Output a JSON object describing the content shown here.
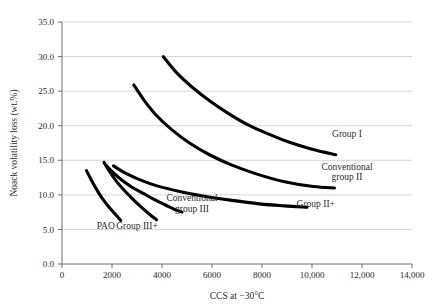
{
  "chart_data": {
    "type": "line",
    "title": "",
    "xlabel": "CCS at −30°C",
    "ylabel": "Noack volatility loss (wt.%)",
    "xlim": [
      0,
      14000
    ],
    "ylim": [
      0,
      35
    ],
    "grid": "horizontal",
    "legend": "inline-labels",
    "x_ticks": [
      "0",
      "2000",
      "4000",
      "6000",
      "8000",
      "10,000",
      "12,000",
      "14,000"
    ],
    "x_tick_values": [
      0,
      2000,
      4000,
      6000,
      8000,
      10000,
      12000,
      14000
    ],
    "y_ticks": [
      "0.0",
      "5.0",
      "10.0",
      "15.0",
      "20.0",
      "25.0",
      "30.0",
      "35.0"
    ],
    "y_tick_values": [
      0,
      5,
      10,
      15,
      20,
      25,
      30,
      35
    ],
    "series": [
      {
        "name": "Group I",
        "label": "Group I",
        "label_lines": [
          "Group I"
        ],
        "label_x": 11400,
        "label_y": 18.3,
        "points": [
          {
            "x": 4050,
            "y": 30.0
          },
          {
            "x": 4600,
            "y": 27.6
          },
          {
            "x": 5200,
            "y": 25.6
          },
          {
            "x": 5900,
            "y": 23.6
          },
          {
            "x": 6600,
            "y": 21.9
          },
          {
            "x": 7400,
            "y": 20.2
          },
          {
            "x": 8200,
            "y": 18.9
          },
          {
            "x": 9100,
            "y": 17.6
          },
          {
            "x": 10000,
            "y": 16.6
          },
          {
            "x": 10950,
            "y": 15.8
          }
        ]
      },
      {
        "name": "Conventional group II",
        "label": "Conventional group II",
        "label_lines": [
          "Conventional",
          "group II"
        ],
        "label_x": 11400,
        "label_y": 13.6,
        "points": [
          {
            "x": 2870,
            "y": 25.9
          },
          {
            "x": 3300,
            "y": 23.6
          },
          {
            "x": 3800,
            "y": 21.4
          },
          {
            "x": 4400,
            "y": 19.4
          },
          {
            "x": 5100,
            "y": 17.5
          },
          {
            "x": 5900,
            "y": 15.8
          },
          {
            "x": 6800,
            "y": 14.3
          },
          {
            "x": 7800,
            "y": 13.0
          },
          {
            "x": 8900,
            "y": 11.9
          },
          {
            "x": 10050,
            "y": 11.2
          },
          {
            "x": 10900,
            "y": 11.0
          }
        ]
      },
      {
        "name": "Group II+",
        "label": "Group II+",
        "label_lines": [
          "Group II+"
        ],
        "label_x": 10150,
        "label_y": 8.3,
        "points": [
          {
            "x": 2060,
            "y": 14.2
          },
          {
            "x": 2500,
            "y": 13.2
          },
          {
            "x": 3100,
            "y": 12.2
          },
          {
            "x": 3800,
            "y": 11.3
          },
          {
            "x": 4700,
            "y": 10.5
          },
          {
            "x": 5700,
            "y": 9.8
          },
          {
            "x": 6800,
            "y": 9.2
          },
          {
            "x": 7900,
            "y": 8.7
          },
          {
            "x": 8900,
            "y": 8.4
          },
          {
            "x": 9800,
            "y": 8.2
          }
        ]
      },
      {
        "name": "Conventional group III",
        "label": "Conventional group III",
        "label_lines": [
          "Conventional",
          "group III"
        ],
        "label_x": 5200,
        "label_y": 9.1,
        "points": [
          {
            "x": 1780,
            "y": 14.2
          },
          {
            "x": 2050,
            "y": 13.2
          },
          {
            "x": 2400,
            "y": 12.1
          },
          {
            "x": 2800,
            "y": 11.1
          },
          {
            "x": 3250,
            "y": 10.2
          },
          {
            "x": 3700,
            "y": 9.3
          },
          {
            "x": 4150,
            "y": 8.5
          },
          {
            "x": 4500,
            "y": 7.9
          },
          {
            "x": 4800,
            "y": 7.5
          }
        ]
      },
      {
        "name": "Group III+",
        "label": "Group III+",
        "label_lines": [
          "Group III+"
        ],
        "label_x": 3000,
        "label_y": 5.0,
        "points": [
          {
            "x": 1680,
            "y": 14.7
          },
          {
            "x": 1900,
            "y": 13.4
          },
          {
            "x": 2150,
            "y": 12.1
          },
          {
            "x": 2450,
            "y": 10.8
          },
          {
            "x": 2800,
            "y": 9.5
          },
          {
            "x": 3150,
            "y": 8.3
          },
          {
            "x": 3500,
            "y": 7.2
          },
          {
            "x": 3780,
            "y": 6.4
          }
        ]
      },
      {
        "name": "PAO",
        "label": "PAO",
        "label_lines": [
          "PAO"
        ],
        "label_x": 1750,
        "label_y": 5.0,
        "points": [
          {
            "x": 980,
            "y": 13.5
          },
          {
            "x": 1150,
            "y": 12.3
          },
          {
            "x": 1350,
            "y": 11.0
          },
          {
            "x": 1570,
            "y": 9.7
          },
          {
            "x": 1820,
            "y": 8.5
          },
          {
            "x": 2080,
            "y": 7.4
          },
          {
            "x": 2350,
            "y": 6.3
          }
        ]
      }
    ]
  },
  "colors": {
    "curve": "#000000",
    "grid": "#c9c9c9",
    "axis": "#6e6e6e",
    "text": "#2b2b2b",
    "background": "#ffffff"
  }
}
